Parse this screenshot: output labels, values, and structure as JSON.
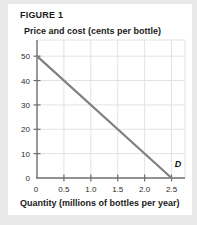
{
  "figure": {
    "title": "FIGURE 1",
    "y_axis_title": "Price and cost (cents per bottle)",
    "x_axis_title": "Quantity (millions of bottles per year)"
  },
  "colors": {
    "demand_line": "#808080",
    "axis": "#6e6e6e",
    "grid": "#e3e3e3",
    "text": "#1b1b1b",
    "background": "#ffffff",
    "page_edge": "#e9e9e9"
  },
  "chart_data": {
    "type": "line",
    "title": "FIGURE 1",
    "subtitle": "Price and cost (cents per bottle)",
    "xlabel": "Quantity (millions of bottles per year)",
    "ylabel": "Price and cost (cents per bottle)",
    "xlim": [
      0,
      2.75
    ],
    "ylim": [
      0,
      55
    ],
    "grid": true,
    "legend_position": "inline-end-label",
    "xticks": [
      0,
      0.5,
      1.0,
      1.5,
      2.0,
      2.5
    ],
    "xtick_labels": [
      "0",
      "0.5",
      "1.0",
      "1.5",
      "2.0",
      "2.5"
    ],
    "yticks": [
      0,
      10,
      20,
      30,
      40,
      50
    ],
    "ytick_labels": [
      "0",
      "10",
      "20",
      "30",
      "40",
      "50"
    ],
    "series": [
      {
        "name": "D",
        "label": "D",
        "color": "#808080",
        "x": [
          0,
          2.5
        ],
        "y": [
          50,
          0
        ],
        "annotation": "D",
        "annotation_x": 2.62,
        "annotation_y": 4.5
      }
    ]
  }
}
